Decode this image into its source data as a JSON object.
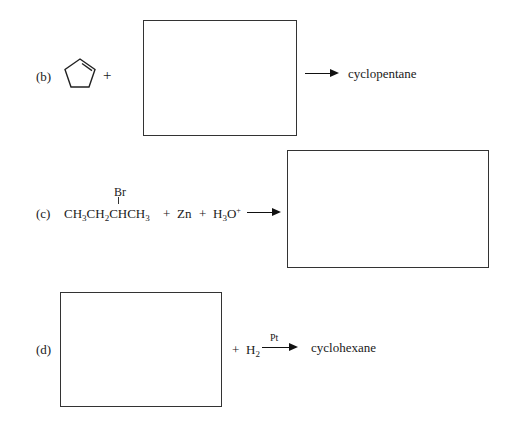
{
  "problems": [
    {
      "label": "(b)",
      "reactant_icon": "cyclopentene-icon",
      "plus": "+",
      "answer_box": "",
      "product": "cyclopentane"
    },
    {
      "label": "(c)",
      "substituent": "Br",
      "reactant_parts": [
        "CH",
        "3",
        "CH",
        "2",
        "CHCH",
        "3"
      ],
      "plus1": "+",
      "reagent1": "Zn",
      "plus2": "+",
      "reagent2_base": "H",
      "reagent2_sub": "3",
      "reagent2_O": "O",
      "reagent2_sup": "+",
      "answer_box": ""
    },
    {
      "label": "(d)",
      "answer_box": "",
      "plus": "+",
      "reagent_base": "H",
      "reagent_sub": "2",
      "catalyst": "Pt",
      "product": "cyclohexane"
    }
  ]
}
